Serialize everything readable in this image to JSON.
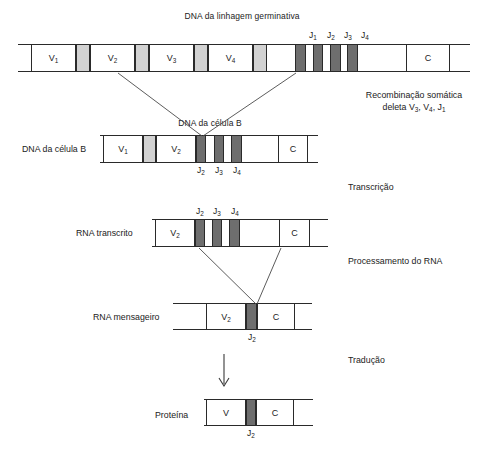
{
  "figure": {
    "title": "DNA da linhagem germinativa",
    "colors": {
      "line": "#2a2a2a",
      "spacer_gray": "#d2d2d2",
      "j_segment_dark": "#6e6e6e",
      "background": "#ffffff",
      "text": "#222222"
    }
  },
  "annotations": [
    {
      "id": "recombination",
      "line1": "Recombinação somática",
      "line2_pre": "deleta V",
      "line2": "deleta V3, V4, J1"
    },
    {
      "id": "transcription",
      "label": "Transcrição"
    },
    {
      "id": "rna-processing",
      "label": "Processamento do RNA"
    },
    {
      "id": "translation",
      "label": "Tradução"
    }
  ],
  "rows": [
    {
      "id": "germline-dna",
      "name": "DNA da linhagem germinativa",
      "name_position": "above-center",
      "segments": [
        {
          "label": "V",
          "sub": "1",
          "type": "box"
        },
        {
          "label": "",
          "sub": "",
          "type": "gray"
        },
        {
          "label": "V",
          "sub": "2",
          "type": "box"
        },
        {
          "label": "",
          "sub": "",
          "type": "gray"
        },
        {
          "label": "V",
          "sub": "3",
          "type": "box"
        },
        {
          "label": "",
          "sub": "",
          "type": "gray"
        },
        {
          "label": "V",
          "sub": "4",
          "type": "box"
        },
        {
          "label": "",
          "sub": "",
          "type": "gray"
        },
        {
          "label": "J",
          "sub": "1",
          "type": "dark"
        },
        {
          "label": "J",
          "sub": "2",
          "type": "dark"
        },
        {
          "label": "J",
          "sub": "3",
          "type": "dark"
        },
        {
          "label": "J",
          "sub": "4",
          "type": "dark"
        },
        {
          "label": "C",
          "sub": "",
          "type": "box"
        }
      ],
      "j_labels": [
        {
          "label": "J",
          "sub": "1"
        },
        {
          "label": "J",
          "sub": "2"
        },
        {
          "label": "J",
          "sub": "3"
        },
        {
          "label": "J",
          "sub": "4"
        }
      ]
    },
    {
      "id": "b-cell-dna",
      "name": "DNA da célula B",
      "caption": "DNA da célula B",
      "segments": [
        {
          "label": "V",
          "sub": "1",
          "type": "box"
        },
        {
          "label": "",
          "sub": "",
          "type": "gray"
        },
        {
          "label": "V",
          "sub": "2",
          "type": "box"
        },
        {
          "label": "J",
          "sub": "2",
          "type": "dark"
        },
        {
          "label": "J",
          "sub": "3",
          "type": "dark"
        },
        {
          "label": "J",
          "sub": "4",
          "type": "dark"
        },
        {
          "label": "C",
          "sub": "",
          "type": "box"
        }
      ],
      "j_labels": [
        {
          "label": "J",
          "sub": "2"
        },
        {
          "label": "J",
          "sub": "3"
        },
        {
          "label": "J",
          "sub": "4"
        }
      ]
    },
    {
      "id": "rna-transcript",
      "name": "RNA transcrito",
      "segments": [
        {
          "label": "V",
          "sub": "2",
          "type": "box"
        },
        {
          "label": "J",
          "sub": "2",
          "type": "dark"
        },
        {
          "label": "J",
          "sub": "3",
          "type": "dark"
        },
        {
          "label": "J",
          "sub": "4",
          "type": "dark"
        },
        {
          "label": "C",
          "sub": "",
          "type": "box"
        }
      ],
      "j_labels": [
        {
          "label": "J",
          "sub": "2"
        },
        {
          "label": "J",
          "sub": "3"
        },
        {
          "label": "J",
          "sub": "4"
        }
      ]
    },
    {
      "id": "messenger-rna",
      "name": "RNA mensageiro",
      "segments": [
        {
          "label": "V",
          "sub": "2",
          "type": "box"
        },
        {
          "label": "J",
          "sub": "2",
          "type": "dark"
        },
        {
          "label": "C",
          "sub": "",
          "type": "box"
        }
      ],
      "j_labels": [
        {
          "label": "J",
          "sub": "2"
        }
      ]
    },
    {
      "id": "protein",
      "name": "Proteína",
      "segments": [
        {
          "label": "V",
          "sub": "",
          "type": "box"
        },
        {
          "label": "J",
          "sub": "2",
          "type": "dark"
        },
        {
          "label": "C",
          "sub": "",
          "type": "box"
        }
      ],
      "j_labels": [
        {
          "label": "J",
          "sub": "2"
        }
      ]
    }
  ]
}
